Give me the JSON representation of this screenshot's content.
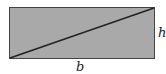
{
  "diagram": {
    "shape": "rectangle",
    "fill_color": "#a9a9a9",
    "stroke_color": "#333333",
    "diagonal": "bottom-left to top-right",
    "labels": {
      "height": "h",
      "base": "b"
    }
  }
}
